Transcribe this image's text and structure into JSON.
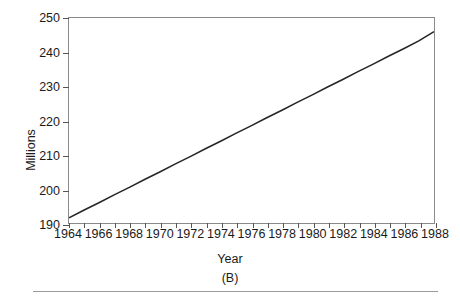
{
  "figure": {
    "caption": "(B)",
    "background": "#ffffff",
    "frame_color": "#8a8a8a",
    "line_color": "#262626"
  },
  "chart_data": {
    "type": "line",
    "title": "",
    "xlabel": "Year",
    "ylabel": "Millions",
    "xlim": [
      1964,
      1988
    ],
    "ylim": [
      190,
      250
    ],
    "grid": false,
    "legend": "none",
    "x_tick_labels": [
      "1964",
      "1966",
      "1968",
      "1970",
      "1972",
      "1974",
      "1976",
      "1978",
      "1980",
      "1982",
      "1984",
      "1986",
      "1988"
    ],
    "x_tick_values": [
      1964,
      1966,
      1968,
      1970,
      1972,
      1974,
      1976,
      1978,
      1980,
      1982,
      1984,
      1986,
      1988
    ],
    "x_minor_tick_values": [
      1964,
      1965,
      1966,
      1967,
      1968,
      1969,
      1970,
      1971,
      1972,
      1973,
      1974,
      1975,
      1976,
      1977,
      1978,
      1979,
      1980,
      1981,
      1982,
      1983,
      1984,
      1985,
      1986,
      1987,
      1988
    ],
    "y_tick_labels": [
      "190",
      "200",
      "210",
      "220",
      "230",
      "240",
      "250"
    ],
    "y_tick_values": [
      190,
      200,
      210,
      220,
      230,
      240,
      250
    ],
    "series": [
      {
        "name": "Population",
        "x": [
          1964,
          1965,
          1966,
          1967,
          1968,
          1969,
          1970,
          1971,
          1972,
          1973,
          1974,
          1975,
          1976,
          1977,
          1978,
          1979,
          1980,
          1981,
          1982,
          1983,
          1984,
          1985,
          1986,
          1987,
          1988
        ],
        "values": [
          191.5,
          193.8,
          196.0,
          198.3,
          200.5,
          202.8,
          205.0,
          207.3,
          209.5,
          211.8,
          214.0,
          216.3,
          218.5,
          220.8,
          223.0,
          225.3,
          227.5,
          229.8,
          232.0,
          234.3,
          236.5,
          238.8,
          241.0,
          243.3,
          246.0
        ]
      }
    ]
  }
}
